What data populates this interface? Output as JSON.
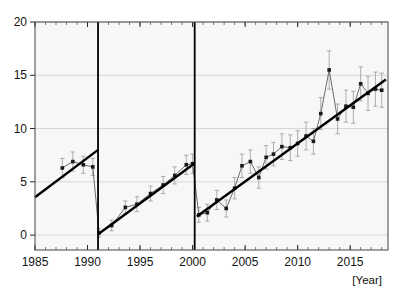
{
  "chart_data": {
    "type": "line",
    "title": "",
    "subtitle": "",
    "xlabel": "[Year]",
    "ylabel": "",
    "xlim": [
      1985,
      2018.6
    ],
    "ylim": [
      -1.4,
      20
    ],
    "grid": true,
    "grid_axis": "y",
    "legend": "none",
    "xticks": [
      1985,
      1990,
      1995,
      2000,
      2005,
      2010,
      2015
    ],
    "xtick_labels": [
      "1985",
      "1990",
      "1995",
      "2000",
      "2005",
      "2010",
      "2015"
    ],
    "yticks": [
      0,
      5,
      10,
      15,
      20
    ],
    "ytick_labels": [
      "0",
      "5",
      "10",
      "15",
      "20"
    ],
    "x_minor_tick_step": 1,
    "annotations": [
      {
        "name": "break-line-1991",
        "type": "vline",
        "x": 1991.0
      },
      {
        "name": "break-line-2000",
        "type": "vline",
        "x": 2000.2
      }
    ],
    "series": [
      {
        "name": "observed",
        "style": "line-marker-errorbar",
        "marker": "square",
        "color": "#1a1a1a",
        "line_color": "#6b6b6b",
        "errorbar_color": "#9a9a9a",
        "x": [
          1987.6,
          1988.6,
          1989.6,
          1990.5,
          1991.1,
          1992.3,
          1993.6,
          1994.7,
          1996.0,
          1997.2,
          1998.3,
          1999.4,
          2000.0,
          2000.6,
          2001.4,
          2002.3,
          2003.2,
          2004.0,
          2004.7,
          2005.5,
          2006.3,
          2007.0,
          2007.7,
          2008.5,
          2009.3,
          2010.0,
          2010.8,
          2011.5,
          2012.2,
          2013.0,
          2013.8,
          2014.6,
          2015.3,
          2016.0,
          2016.7,
          2017.4,
          2018.0
        ],
        "y": [
          6.3,
          6.9,
          6.6,
          6.4,
          0.2,
          0.9,
          2.6,
          2.9,
          3.9,
          4.7,
          5.6,
          6.6,
          6.7,
          1.9,
          2.1,
          3.3,
          2.5,
          4.4,
          6.5,
          6.9,
          5.4,
          7.3,
          7.6,
          8.3,
          8.2,
          8.6,
          9.3,
          8.8,
          11.4,
          15.5,
          10.9,
          12.1,
          12.0,
          14.2,
          13.3,
          13.7,
          13.6
        ],
        "yerr": [
          0.9,
          0.9,
          0.8,
          0.8,
          0.4,
          0.5,
          0.6,
          0.7,
          0.7,
          0.8,
          0.8,
          0.9,
          0.9,
          0.7,
          0.8,
          0.9,
          0.8,
          1.0,
          1.1,
          1.1,
          1.0,
          1.1,
          1.1,
          1.2,
          1.2,
          1.2,
          1.3,
          1.2,
          1.5,
          1.8,
          1.4,
          1.5,
          1.5,
          1.6,
          1.6,
          1.6,
          1.6
        ]
      },
      {
        "name": "trend-segment-1",
        "style": "thick-trend-line",
        "color": "#000000",
        "x": [
          1985.0,
          1991.0
        ],
        "y": [
          3.55,
          8.0
        ]
      },
      {
        "name": "trend-segment-2",
        "style": "thick-trend-line",
        "color": "#000000",
        "x": [
          1991.1,
          2000.2
        ],
        "y": [
          0.15,
          6.75
        ]
      },
      {
        "name": "trend-segment-3",
        "style": "thick-trend-line",
        "color": "#000000",
        "x": [
          2000.4,
          2018.4
        ],
        "y": [
          1.75,
          14.6
        ]
      }
    ]
  },
  "plot": {
    "left": 35,
    "top": 22,
    "right": 388,
    "bottom": 250
  }
}
